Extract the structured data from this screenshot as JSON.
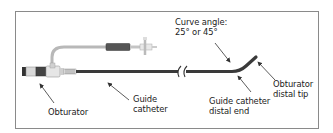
{
  "figure": {
    "labels": {
      "obturator": "Obturator",
      "guide_catheter": [
        "Guide",
        "catheter"
      ],
      "curve_angle": [
        "Curve angle:",
        "25° or 45°"
      ],
      "guide_catheter_distal_end": [
        "Guide catheter",
        "distal end"
      ],
      "obturator_distal_tip": [
        "Obturator",
        "distal tip"
      ]
    },
    "colors": {
      "border": "#8a8a8a",
      "catheter_shaft": "#3a3a3a",
      "side_tube": "#b5b5b5",
      "dark_band": "#444444",
      "label_text": "#222222",
      "arrow": "#333333"
    }
  }
}
